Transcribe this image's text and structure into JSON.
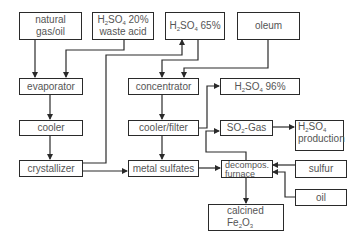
{
  "diagram": {
    "nodes": {
      "natural_gas": {
        "line1": "natural",
        "line2": "gas/oil"
      },
      "waste_acid": {
        "formula_pre": "H",
        "formula_sub1": "2",
        "formula_mid": "SO",
        "formula_sub2": "4",
        "suffix": " 20%",
        "line2": "waste acid"
      },
      "acid65": {
        "formula_pre": "H",
        "formula_sub1": "2",
        "formula_mid": "SO",
        "formula_sub2": "4",
        "suffix": " 65%"
      },
      "oleum": {
        "label": "oleum"
      },
      "evaporator": {
        "label": "evaporator"
      },
      "concentrator": {
        "label": "concentrator"
      },
      "acid96": {
        "formula_pre": "H",
        "formula_sub1": "2",
        "formula_mid": "SO",
        "formula_sub2": "4",
        "suffix": " 96%"
      },
      "cooler": {
        "label": "cooler"
      },
      "cooler_filter": {
        "label": "cooler/filter"
      },
      "so2_gas": {
        "pre": "SO",
        "sub": "2",
        "suffix": "-Gas"
      },
      "acid_production": {
        "formula_pre": "H",
        "formula_sub1": "2",
        "formula_mid": "SO",
        "formula_sub2": "4",
        "line2": "production"
      },
      "crystallizer": {
        "label": "crystallizer"
      },
      "metal_sulfates": {
        "label": "metal sulfates"
      },
      "furnace": {
        "line1": "decompos.",
        "line2": "furnace"
      },
      "sulfur": {
        "label": "sulfur"
      },
      "oil": {
        "label": "oil"
      },
      "calcined": {
        "line1": "calcined",
        "fe": "Fe",
        "sub1": "2",
        "o": "O",
        "sub2": "3"
      }
    },
    "colors": {
      "line": "#2a2a2a",
      "text": "#555555",
      "background": "#ffffff"
    }
  }
}
